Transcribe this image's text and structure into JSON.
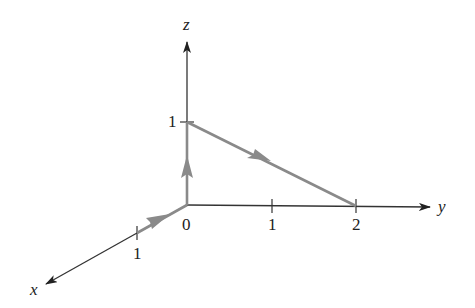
{
  "diagram": {
    "type": "3d-axes-path",
    "axes": {
      "x": {
        "label": "x",
        "ticks": [
          {
            "value": 1,
            "label": "1"
          }
        ]
      },
      "y": {
        "label": "y",
        "ticks": [
          {
            "value": 1,
            "label": "1"
          },
          {
            "value": 2,
            "label": "2"
          }
        ]
      },
      "z": {
        "label": "z",
        "ticks": [
          {
            "value": 1,
            "label": "1"
          }
        ]
      },
      "origin_label": "0"
    },
    "path": {
      "segments": [
        {
          "from": [
            1,
            0,
            0
          ],
          "to": [
            0,
            0,
            0
          ]
        },
        {
          "from": [
            0,
            0,
            0
          ],
          "to": [
            0,
            0,
            1
          ]
        },
        {
          "from": [
            0,
            0,
            1
          ],
          "to": [
            0,
            2,
            0
          ]
        }
      ],
      "color": "#8a8a8a"
    },
    "axis_color": "#222222"
  }
}
